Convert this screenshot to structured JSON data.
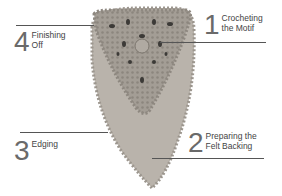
{
  "diagram": {
    "colors": {
      "background": "#ffffff",
      "felt": "#b9b3ab",
      "lace": "#9a948c",
      "lace_holes": "#3c3a37",
      "leader_lines": "#555555",
      "numbers": "#6a6a6a",
      "labels": "#444444"
    },
    "steps": [
      {
        "number": "1",
        "label": "Crocheting\nthe Motif"
      },
      {
        "number": "2",
        "label": "Preparing the\nFelt Backing"
      },
      {
        "number": "3",
        "label": "Edging"
      },
      {
        "number": "4",
        "label": "Finishing\nOff"
      }
    ]
  }
}
